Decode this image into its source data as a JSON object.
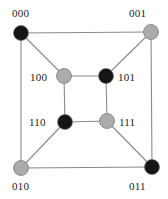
{
  "figure": {
    "name": "hypercube-q3-graph",
    "width": 168,
    "height": 199,
    "background_color": "#ffffff"
  },
  "colors": {
    "node_black": "#151515",
    "node_gray": "#ababab",
    "node_outline": "#6e6e6e",
    "edge": "#8a8a8a",
    "label_text": "#1a1a1a"
  },
  "chart_data": {
    "type": "diagram",
    "title": "",
    "graph": "3-dimensional hypercube (Q3) drawn as nested squares",
    "nodes": [
      {
        "id": "000",
        "label": "000",
        "fill": "black",
        "cx": 21,
        "cy": 33,
        "r": 7.5,
        "label_x": 12,
        "label_y": 8,
        "label_anchor": "top-left"
      },
      {
        "id": "001",
        "label": "001",
        "fill": "gray",
        "cx": 151,
        "cy": 32,
        "r": 7.5,
        "label_x": 129,
        "label_y": 8,
        "label_anchor": "top-right"
      },
      {
        "id": "010",
        "label": "010",
        "fill": "gray",
        "cx": 21,
        "cy": 168,
        "r": 7.5,
        "label_x": 12,
        "label_y": 181,
        "label_anchor": "bottom-left"
      },
      {
        "id": "011",
        "label": "011",
        "fill": "black",
        "cx": 152,
        "cy": 167,
        "r": 7.5,
        "label_x": 129,
        "label_y": 181,
        "label_anchor": "bottom-right"
      },
      {
        "id": "100",
        "label": "100",
        "fill": "gray",
        "cx": 64,
        "cy": 76,
        "r": 7.5,
        "label_x": 30,
        "label_y": 72,
        "label_anchor": "left"
      },
      {
        "id": "101",
        "label": "101",
        "fill": "black",
        "cx": 106,
        "cy": 76,
        "r": 7.5,
        "label_x": 118,
        "label_y": 72,
        "label_anchor": "right"
      },
      {
        "id": "110",
        "label": "110",
        "fill": "black",
        "cx": 65,
        "cy": 122,
        "r": 7.5,
        "label_x": 29,
        "label_y": 117,
        "label_anchor": "left"
      },
      {
        "id": "111",
        "label": "111",
        "fill": "gray",
        "cx": 107,
        "cy": 121,
        "r": 7.5,
        "label_x": 119,
        "label_y": 117,
        "label_anchor": "right"
      }
    ],
    "edges": [
      {
        "from": "000",
        "to": "001",
        "kind": "outer-top"
      },
      {
        "from": "001",
        "to": "011",
        "kind": "outer-right"
      },
      {
        "from": "011",
        "to": "010",
        "kind": "outer-bottom"
      },
      {
        "from": "010",
        "to": "000",
        "kind": "outer-left"
      },
      {
        "from": "100",
        "to": "101",
        "kind": "inner-top"
      },
      {
        "from": "101",
        "to": "111",
        "kind": "inner-right"
      },
      {
        "from": "111",
        "to": "110",
        "kind": "inner-bottom"
      },
      {
        "from": "110",
        "to": "100",
        "kind": "inner-left"
      },
      {
        "from": "000",
        "to": "100",
        "kind": "diagonal"
      },
      {
        "from": "001",
        "to": "101",
        "kind": "diagonal"
      },
      {
        "from": "010",
        "to": "110",
        "kind": "diagonal"
      },
      {
        "from": "011",
        "to": "111",
        "kind": "diagonal"
      }
    ]
  }
}
